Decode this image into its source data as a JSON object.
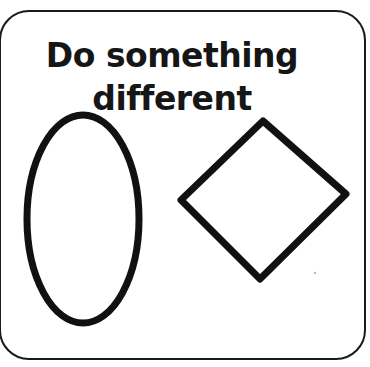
{
  "card": {
    "title_lines": [
      "Do something",
      "different"
    ],
    "border_color": "#1a1a1a"
  },
  "shapes": [
    {
      "type": "ellipse",
      "name": "oval",
      "cx": 83,
      "cy": 219,
      "rx": 56,
      "ry": 104,
      "stroke": "#111111",
      "stroke_width": 7
    },
    {
      "type": "diamond",
      "name": "diamond",
      "points": [
        [
          263,
          121
        ],
        [
          346,
          194
        ],
        [
          260,
          279
        ],
        [
          181,
          200
        ]
      ],
      "stroke": "#111111",
      "stroke_width": 7
    }
  ]
}
